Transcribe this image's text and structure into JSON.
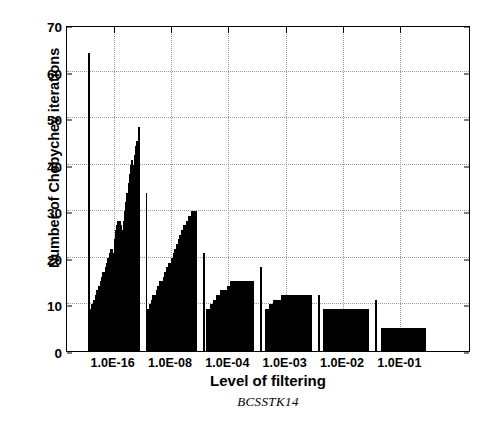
{
  "chart_data": {
    "type": "bar",
    "title": "",
    "subtitle": "BCSSTK14",
    "xlabel": "Level of filtering",
    "ylabel": "Number of Chebychev iterations",
    "ylim": [
      0,
      70
    ],
    "yticks": [
      0,
      10,
      20,
      30,
      40,
      50,
      60,
      70
    ],
    "grid": true,
    "legend": null,
    "categories": [
      "1.0E-16",
      "1.0E-08",
      "1.0E-04",
      "1.0E-03",
      "1.0E-02",
      "1.0E-01"
    ],
    "note": "Each category is a dense cluster of thin bars (a staircase profile of per-run Chebychev iteration counts). Values are listed left-to-right within each cluster.",
    "groups": [
      {
        "category": "1.0E-16",
        "values": [
          64,
          9,
          10,
          10,
          11,
          12,
          13,
          13,
          14,
          15,
          16,
          17,
          17,
          18,
          19,
          20,
          21,
          22,
          22,
          21,
          24,
          26,
          27,
          28,
          28,
          27,
          26,
          28,
          30,
          32,
          34,
          36,
          38,
          40,
          41,
          40,
          42,
          44,
          45,
          48
        ],
        "peak": 64,
        "secondary_peak": 48
      },
      {
        "category": "1.0E-08",
        "values": [
          34,
          9,
          10,
          11,
          12,
          12,
          13,
          14,
          15,
          15,
          16,
          17,
          18,
          19,
          19,
          20,
          21,
          22,
          23,
          24,
          25,
          26,
          27,
          27,
          28,
          29,
          29,
          30,
          30,
          30
        ],
        "peak": 34,
        "secondary_peak": 30
      },
      {
        "category": "1.0E-04",
        "values": [
          21,
          9,
          10,
          11,
          12,
          13,
          13,
          14,
          15,
          15,
          15,
          15,
          15,
          15,
          15
        ],
        "peak": 21,
        "secondary_peak": 15
      },
      {
        "category": "1.0E-03",
        "values": [
          18,
          9,
          10,
          11,
          11,
          12,
          12,
          12,
          12,
          12,
          12,
          12
        ],
        "peak": 18,
        "secondary_peak": 12
      },
      {
        "category": "1.0E-02",
        "values": [
          12,
          9,
          9,
          9,
          9,
          9,
          9,
          9,
          9,
          9
        ],
        "peak": 12,
        "secondary_peak": 9
      },
      {
        "category": "1.0E-01",
        "values": [
          11,
          5,
          5,
          5,
          5,
          5,
          5,
          5,
          5
        ],
        "peak": 11,
        "secondary_peak": 5
      }
    ]
  },
  "figure": {
    "bar_color": "#000000",
    "background_color": "#ffffff",
    "axis_color": "#000000",
    "grid_color": "#9a9a9a"
  }
}
